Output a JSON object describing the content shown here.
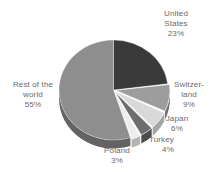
{
  "chart_data": {
    "type": "pie",
    "title": "",
    "subtitle": "",
    "xlabel": "",
    "ylabel": "",
    "legend_position": "none",
    "grid": false,
    "style": "3d-pie",
    "start_angle_deg": 0,
    "direction": "clockwise",
    "units": "percent",
    "total": 100,
    "categories": [
      "United States",
      "Switzerland",
      "Japan",
      "Turkey",
      "Poland",
      "Rest of the world"
    ],
    "values": [
      23,
      9,
      6,
      4,
      3,
      55
    ],
    "slices": [
      {
        "key": "united-states",
        "name": "United States",
        "value": 23,
        "value_label": "23%",
        "color": "#3a3a3a",
        "side_color": "#242424",
        "exploded": false
      },
      {
        "key": "switzerland",
        "name": "Switzerland",
        "value": 9,
        "value_label": "9%",
        "color": "#9d9d9d",
        "side_color": "#6f6f6f",
        "exploded": true
      },
      {
        "key": "japan",
        "name": "Japan",
        "value": 6,
        "value_label": "6%",
        "color": "#d9d9d9",
        "side_color": "#a5a5a5",
        "exploded": true
      },
      {
        "key": "turkey",
        "name": "Turkey",
        "value": 4,
        "value_label": "4%",
        "color": "#6e6e6e",
        "side_color": "#4c4c4c",
        "exploded": true
      },
      {
        "key": "poland",
        "name": "Poland",
        "value": 3,
        "value_label": "3%",
        "color": "#ededed",
        "side_color": "#b4b4b4",
        "exploded": true
      },
      {
        "key": "rest-of-world",
        "name": "Rest of the world",
        "value": 55,
        "value_label": "55%",
        "color": "#8e8e8e",
        "side_color": "#636363",
        "exploded": false
      }
    ]
  },
  "labels": {
    "united_states": {
      "line1": "United",
      "line2": "States",
      "line3": "23%"
    },
    "switzerland": {
      "line1": "Switzer-",
      "line2": "land",
      "line3": "9%"
    },
    "japan": {
      "line1": "Japan",
      "line2": "6%"
    },
    "turkey": {
      "line1": "Turkey",
      "line2": "4%"
    },
    "poland": {
      "line1": "Poland",
      "line2": "3%"
    },
    "rest_of_world": {
      "line1": "Rest of the",
      "line2": "world",
      "line3": "55%"
    }
  },
  "colors": {
    "background": "#ffffff",
    "label_text": "#6b6b6b",
    "slice_gap": "#ffffff"
  }
}
